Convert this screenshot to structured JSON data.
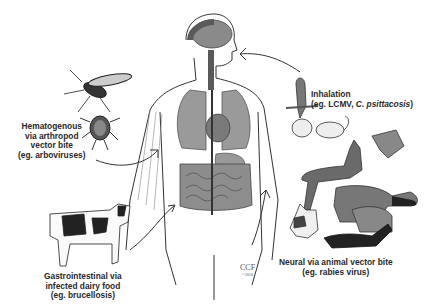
{
  "diagram": {
    "routes": [
      {
        "id": "hematogenous",
        "lines": [
          "Hematogenous",
          "via arthropod",
          "vector bite",
          "(eg. arboviruses)"
        ],
        "vectors": [
          "mosquito",
          "tick"
        ]
      },
      {
        "id": "inhalation",
        "lines": [
          "Inhalation",
          "(eg. LCMV, ",
          "C. psittacosis",
          ")"
        ],
        "vectors": [
          "parakeet",
          "rodents"
        ]
      },
      {
        "id": "gastrointestinal",
        "lines": [
          "Gastrointestinal via",
          "infected dairy food",
          "(eg. brucellosis)"
        ],
        "vectors": [
          "cow"
        ]
      },
      {
        "id": "neural",
        "lines": [
          "Neural via animal vector bite",
          "(eg. rabies virus)"
        ],
        "vectors": [
          "bat",
          "dog",
          "fox",
          "cat",
          "raccoon",
          "skunk"
        ]
      }
    ],
    "credit": {
      "name": "CCF",
      "year": "©2010"
    },
    "colors": {
      "background": "#ffffff",
      "ink": "#2a2a2a",
      "organ_gray": "#8a8a8a",
      "dark_gray": "#4a4a4a"
    }
  }
}
